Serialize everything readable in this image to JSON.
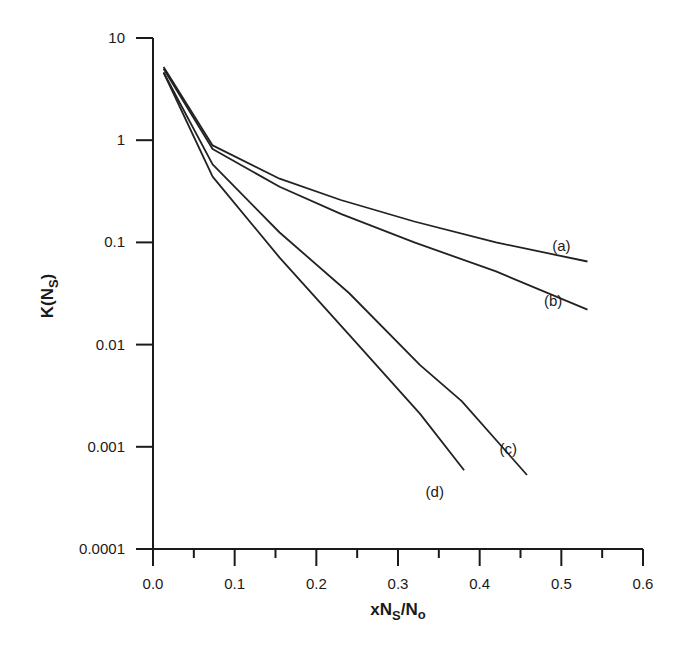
{
  "chart_data": {
    "type": "line",
    "title": "",
    "xlabel": "xN_S/N_o",
    "ylabel": "K(N_S)",
    "xscale": "linear",
    "yscale": "log",
    "xlim": [
      0.0,
      0.6
    ],
    "ylim": [
      0.0001,
      10
    ],
    "grid": false,
    "legend": "inline curve labels",
    "x_ticks": [
      "0.0",
      "0.1",
      "0.2",
      "0.3",
      "0.4",
      "0.5",
      "0.6"
    ],
    "y_ticks": [
      "10",
      "1",
      "0.1",
      "0.01",
      "0.001",
      "0.0001"
    ],
    "series": [
      {
        "name": "(a)",
        "x": [
          0.013,
          0.073,
          0.155,
          0.23,
          0.32,
          0.42,
          0.532
        ],
        "values": [
          5.2,
          0.89,
          0.42,
          0.26,
          0.16,
          0.1,
          0.065
        ],
        "label_pos": [
          0.5,
          0.083
        ]
      },
      {
        "name": "(b)",
        "x": [
          0.013,
          0.073,
          0.155,
          0.23,
          0.32,
          0.42,
          0.532
        ],
        "values": [
          5.0,
          0.82,
          0.35,
          0.19,
          0.1,
          0.052,
          0.022
        ],
        "label_pos": [
          0.49,
          0.024
        ]
      },
      {
        "name": "(c)",
        "x": [
          0.013,
          0.073,
          0.155,
          0.24,
          0.327,
          0.378,
          0.458
        ],
        "values": [
          4.6,
          0.58,
          0.125,
          0.032,
          0.0063,
          0.0028,
          0.00053
        ],
        "label_pos": [
          0.435,
          0.00085
        ]
      },
      {
        "name": "(d)",
        "x": [
          0.013,
          0.073,
          0.155,
          0.24,
          0.327,
          0.381
        ],
        "values": [
          4.6,
          0.44,
          0.071,
          0.0125,
          0.0021,
          0.00059
        ],
        "label_pos": [
          0.345,
          0.00032
        ]
      }
    ]
  },
  "axes": {
    "x_title_main": "xN",
    "x_title_sub1": "S",
    "x_title_mid": "/N",
    "x_title_sub2": "o",
    "y_title_main": "K(N",
    "y_title_sub": "S",
    "y_title_close": ")"
  }
}
